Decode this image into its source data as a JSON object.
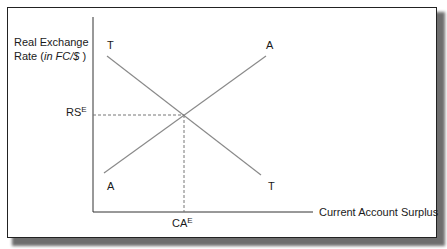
{
  "diagram": {
    "y_axis_label_line1": "Real Exchange",
    "y_axis_label_line2_prefix": "Rate (",
    "y_axis_label_line2_italic": "in FC/$",
    "y_axis_label_line2_suffix": " )",
    "x_axis_label": "Current Account Surplus",
    "rs_label": "RS",
    "rs_sup": "E",
    "ca_label": "CA",
    "ca_sup": "E",
    "curves": [
      {
        "name": "T",
        "label_top": "T",
        "label_bottom": "T",
        "slope": "downward"
      },
      {
        "name": "A",
        "label_top": "A",
        "label_bottom": "A",
        "slope": "upward"
      }
    ],
    "colors": {
      "axis": "#333333",
      "curve": "#8a8a8a",
      "dashed": "#777777",
      "frame": "#222222",
      "shadow": "#6e6e6e"
    }
  }
}
